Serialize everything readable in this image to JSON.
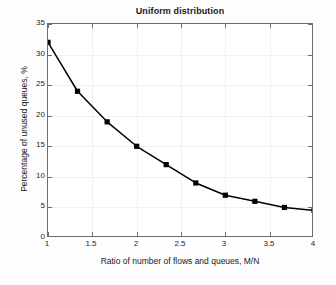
{
  "chart_data": {
    "type": "line",
    "title": "Uniform distribution",
    "xlabel": "Ratio of number of flows and queues, M/N",
    "ylabel": "Percentage of unused queues, %",
    "xlim": [
      1,
      4
    ],
    "ylim": [
      0,
      35
    ],
    "xticks": [
      1,
      1.5,
      2,
      2.5,
      3,
      3.5,
      4
    ],
    "xticklabels": [
      "1",
      "1.5",
      "2",
      "2.5",
      "3",
      "3.5",
      "4"
    ],
    "yticks": [
      0,
      5,
      10,
      15,
      20,
      25,
      30,
      35
    ],
    "yticklabels": [
      "0",
      "5",
      "10",
      "15",
      "20",
      "25",
      "30",
      "35"
    ],
    "grid": true,
    "legend": null,
    "series": [
      {
        "name": "Uniform distribution",
        "marker": "square",
        "color": "#000000",
        "x": [
          1,
          1.333,
          1.667,
          2,
          2.333,
          2.667,
          3,
          3.333,
          3.667,
          4
        ],
        "y": [
          32,
          24,
          19,
          15,
          12,
          9,
          7,
          6,
          5,
          4.5
        ]
      }
    ]
  }
}
